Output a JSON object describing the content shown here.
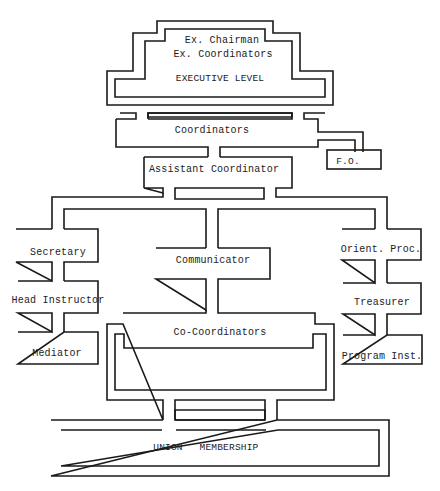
{
  "diagram": {
    "type": "organizational-chart",
    "style": "typewritten double-line boxes",
    "line_color": "#1a1a1a",
    "background": "#ffffff",
    "nodes": {
      "executive_chairman": "Ex. Chairman",
      "executive_coordinators": "Ex. Coordinators",
      "executive_level": "EXECUTIVE LEVEL",
      "coordinators": "Coordinators",
      "fo": "F.O.",
      "assistant_coordinator": "Assistant Coordinator",
      "secretary": "Secretary",
      "head_instructor": "Head Instructor",
      "mediator": "Mediator",
      "communicator": "Communicator",
      "orient_proc": "Orient. Proc.",
      "treasurer": "Treasurer",
      "program_inst": "Program Inst.",
      "co_coordinators": "Co-Coordinators",
      "union": "UNION",
      "membership": "MEMBERSHIP"
    },
    "hierarchy": [
      {
        "level": 1,
        "node": "EXECUTIVE LEVEL",
        "members": [
          "Ex. Chairman",
          "Ex. Coordinators"
        ]
      },
      {
        "level": 2,
        "node": "Coordinators",
        "side": "F.O."
      },
      {
        "level": 3,
        "node": "Assistant Coordinator"
      },
      {
        "level": 4,
        "branches": [
          [
            "Secretary",
            "Head Instructor",
            "Mediator"
          ],
          [
            "Communicator",
            "Co-Coordinators"
          ],
          [
            "Orient. Proc.",
            "Treasurer",
            "Program Inst."
          ]
        ]
      },
      {
        "level": 5,
        "node": "UNION MEMBERSHIP"
      }
    ]
  }
}
